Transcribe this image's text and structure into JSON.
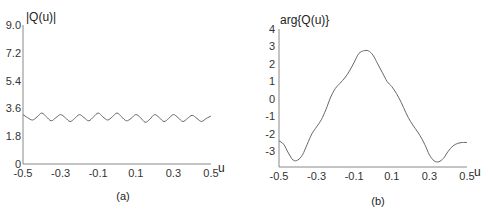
{
  "chart_data": [
    {
      "type": "line",
      "panel": "(a)",
      "title": "",
      "ylabel": "|Q(u)|",
      "xlabel": "u",
      "xlim": [
        -0.5,
        0.5
      ],
      "ylim": [
        0,
        9.0
      ],
      "xticks": [
        "-0.5",
        "-0.3",
        "-0.1",
        "0.1",
        "0.3",
        "0.5"
      ],
      "yticks": [
        "0",
        "1.8",
        "3.6",
        "5.4",
        "7.2",
        "9.0"
      ],
      "grid": false,
      "series": [
        {
          "name": "|Q(u)|",
          "x": [
            -0.5,
            -0.475,
            -0.45,
            -0.425,
            -0.4,
            -0.375,
            -0.35,
            -0.325,
            -0.3,
            -0.275,
            -0.25,
            -0.225,
            -0.2,
            -0.175,
            -0.15,
            -0.125,
            -0.1,
            -0.075,
            -0.05,
            -0.025,
            0.0,
            0.025,
            0.05,
            0.075,
            0.1,
            0.125,
            0.15,
            0.175,
            0.2,
            0.225,
            0.25,
            0.275,
            0.3,
            0.325,
            0.35,
            0.375,
            0.4,
            0.425,
            0.45,
            0.475,
            0.5
          ],
          "y": [
            3.2,
            3.0,
            2.85,
            3.05,
            3.3,
            3.05,
            2.8,
            3.0,
            3.2,
            3.0,
            2.75,
            2.95,
            3.2,
            3.0,
            2.8,
            3.05,
            3.3,
            3.05,
            2.85,
            3.05,
            3.3,
            3.05,
            2.8,
            2.95,
            3.2,
            3.0,
            2.7,
            2.9,
            3.2,
            3.0,
            2.75,
            2.95,
            3.2,
            3.0,
            2.75,
            2.95,
            3.15,
            2.95,
            2.75,
            2.95,
            3.1
          ]
        }
      ]
    },
    {
      "type": "line",
      "panel": "(b)",
      "title": "",
      "ylabel": "arg{Q(u)}",
      "xlabel": "u",
      "xlim": [
        -0.5,
        0.5
      ],
      "ylim": [
        -3.9,
        4
      ],
      "xticks": [
        "-0.5",
        "-0.3",
        "-0.1",
        "0.1",
        "0.3",
        "0.5"
      ],
      "yticks": [
        "-3",
        "-2",
        "-1",
        "0",
        "1",
        "2",
        "3",
        "4"
      ],
      "grid": false,
      "series": [
        {
          "name": "arg{Q(u)}",
          "x": [
            -0.5,
            -0.475,
            -0.45,
            -0.425,
            -0.4,
            -0.375,
            -0.35,
            -0.325,
            -0.3,
            -0.275,
            -0.25,
            -0.225,
            -0.2,
            -0.175,
            -0.15,
            -0.125,
            -0.1,
            -0.075,
            -0.05,
            -0.025,
            0.0,
            0.025,
            0.05,
            0.075,
            0.1,
            0.125,
            0.15,
            0.175,
            0.2,
            0.225,
            0.25,
            0.275,
            0.3,
            0.325,
            0.35,
            0.375,
            0.4,
            0.425,
            0.45,
            0.475,
            0.5
          ],
          "y": [
            -2.4,
            -2.6,
            -3.1,
            -3.5,
            -3.5,
            -3.2,
            -2.6,
            -2.0,
            -1.6,
            -1.2,
            -0.6,
            0.1,
            0.6,
            0.9,
            1.2,
            1.6,
            2.1,
            2.6,
            2.75,
            2.75,
            2.5,
            2.0,
            1.5,
            1.0,
            0.7,
            0.3,
            -0.2,
            -0.8,
            -1.3,
            -1.7,
            -2.1,
            -2.6,
            -3.2,
            -3.55,
            -3.6,
            -3.4,
            -3.0,
            -2.7,
            -2.55,
            -2.5,
            -2.5
          ]
        }
      ]
    }
  ],
  "captions": {
    "a": "(a)",
    "b": "(b)"
  }
}
